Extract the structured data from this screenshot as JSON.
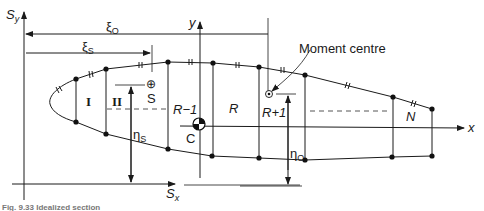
{
  "figure": {
    "axes": {
      "sy_label": "S",
      "sy_sub": "y",
      "sx_label": "S",
      "sx_sub": "x",
      "y_label": "y",
      "x_label": "x"
    },
    "dimensions": {
      "xi_o": "ξ",
      "xi_o_sub": "O",
      "xi_s": "ξ",
      "xi_s_sub": "S",
      "eta_s": "η",
      "eta_s_sub": "S",
      "eta_o": "η",
      "eta_o_sub": "O"
    },
    "points": {
      "shear_centre_symbol": "⊕",
      "shear_centre_label": "S",
      "centroid_label": "C",
      "moment_centre_label": "Moment centre"
    },
    "panels": {
      "panel_1": "I",
      "panel_2": "II",
      "panel_r_minus_1": "R−1",
      "panel_r": "R",
      "panel_r_plus_1": "R+1",
      "panel_n": "N"
    },
    "caption": "Fig. 9.33  Idealized section"
  }
}
